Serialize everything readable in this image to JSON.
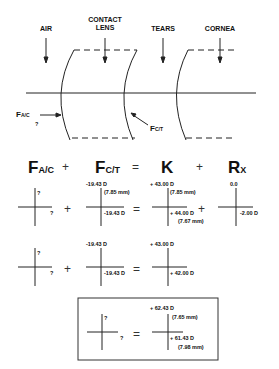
{
  "labels": {
    "air": "AIR",
    "contact_lens_1": "CONTACT",
    "contact_lens_2": "LENS",
    "tears": "TEARS",
    "cornea": "CORNEA",
    "f_ac": "F",
    "f_ac_sub": "A/C",
    "f_ac_q": "?",
    "f_ct": "F",
    "f_ct_sub": "C/T"
  },
  "equation": {
    "t1": "F",
    "t1_sub": "A/C",
    "op1": "+",
    "t2": "F",
    "t2_sub": "C/T",
    "op2": "=",
    "t3": "K",
    "op3": "+",
    "t4": "R",
    "t4_sub": "X"
  },
  "row1": {
    "c1_top": "?",
    "c1_right": "?",
    "op1": "+",
    "c2_top": "-19.43 D",
    "c2_top_mm": "(7.85 mm)",
    "c2_right": "-19.43 D",
    "op2": "=",
    "c3_top": "+ 43.00 D",
    "c3_top_mm": "(7.85 mm)",
    "c3_right": "+ 44.00 D",
    "c3_right_mm": "(7.67 mm)",
    "op3": "+",
    "c4_top": "0.0",
    "c4_right": "-2.00 D"
  },
  "row2": {
    "c1_top": "?",
    "c1_right": "?",
    "op1": "+",
    "c2_top": "-19.43 D",
    "c2_right": "-19.43 D",
    "op2": "=",
    "c3_top": "+ 43.00 D",
    "c3_right": "+ 42.00 D"
  },
  "result_box": {
    "c1_top": "?",
    "c1_right": "?",
    "op": "=",
    "c2_top": "+ 62.43 D",
    "c2_top_mm": "(7.65 mm)",
    "c2_right": "+ 61.43 D",
    "c2_right_mm": "(7.98 mm)"
  }
}
